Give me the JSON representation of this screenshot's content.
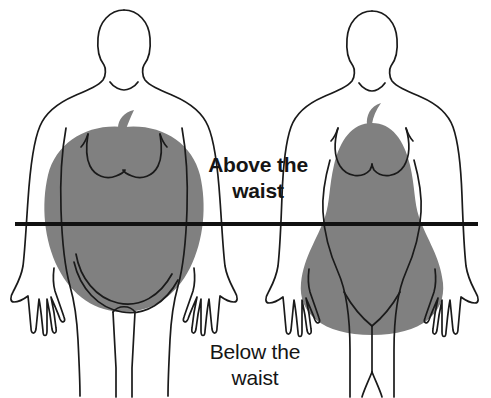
{
  "diagram": {
    "background_color": "#ffffff",
    "outline_color": "#1a1a1a",
    "fat_fill_color": "#808080",
    "waist_line_color": "#111111"
  },
  "labels": {
    "above_the_waist": "Above the\nwaist",
    "below_the_waist": "Below the\nwaist"
  },
  "waist_line": {
    "name": "waist-line",
    "x_start": 15,
    "x_end": 478,
    "y": 224,
    "thickness": 4
  },
  "figures": [
    {
      "id": "apple-figure",
      "side": "left",
      "fat_shape": "apple",
      "description": "Male body outline with apple-shaped fat distribution concentrated above the waist",
      "center_x": 124,
      "shape_fill": "#808080"
    },
    {
      "id": "pear-figure",
      "side": "right",
      "fat_shape": "pear",
      "description": "Female body outline with pear-shaped fat distribution concentrated below the waist",
      "center_x": 372,
      "shape_fill": "#808080"
    }
  ],
  "icons": {
    "apple_stem": "apple-stem-icon",
    "pear_stem": "pear-stem-icon"
  }
}
